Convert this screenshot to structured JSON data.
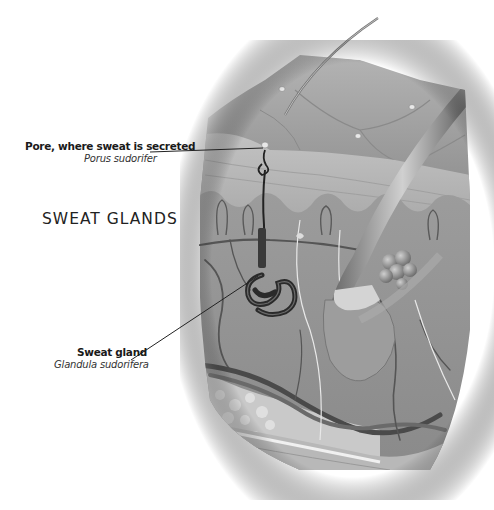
{
  "diagram": {
    "title": "SWEAT GLANDS",
    "labels": [
      {
        "name": "Pore, where sweat is secreted",
        "latin": "Porus sudorifer"
      },
      {
        "name": "Sweat gland",
        "latin": "Glandula sudorifera"
      }
    ],
    "colors": {
      "background": "#ffffff",
      "skin": "#9a9a9a",
      "text": "#1a1a1a",
      "leader_line": "#222222"
    }
  }
}
